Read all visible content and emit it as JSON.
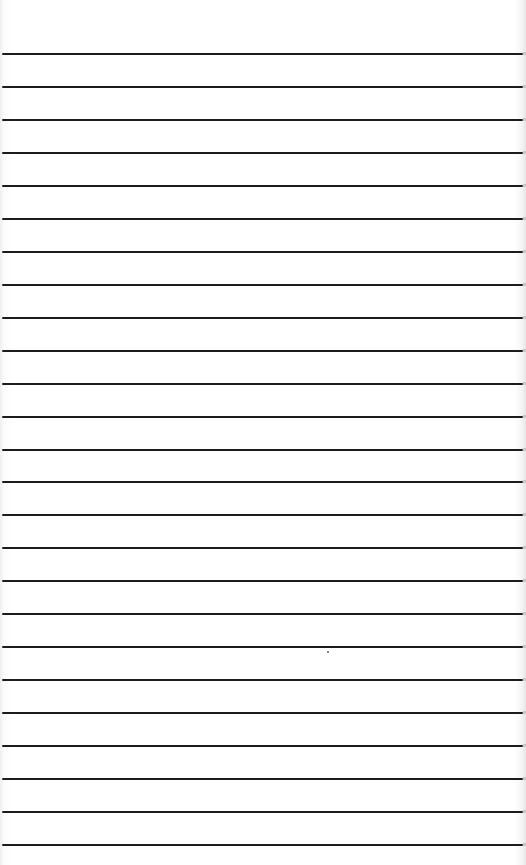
{
  "page": {
    "type": "lined-paper",
    "background_color": "#ffffff",
    "rule_color": "#1c1c1c",
    "rule_count": 25,
    "first_rule_y": 53,
    "rule_spacing": 32.96
  }
}
